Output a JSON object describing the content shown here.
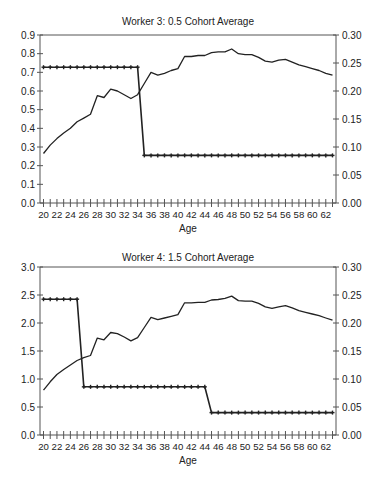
{
  "chart_data": [
    {
      "type": "line",
      "title": "Worker 3: 0.5 Cohort Average",
      "xlabel": "Age",
      "ylabel": "",
      "ylim": [
        0,
        0.9
      ],
      "y2lim": [
        0,
        0.3
      ],
      "yticks": [
        "0.0",
        "0.1",
        "0.2",
        "0.3",
        "0.4",
        "0.5",
        "0.6",
        "0.7",
        "0.8",
        "0.9"
      ],
      "y2ticks": [
        "0.00",
        "0.05",
        "0.10",
        "0.15",
        "0.20",
        "0.25",
        "0.30"
      ],
      "xticks": [
        "20",
        "22",
        "24",
        "26",
        "28",
        "30",
        "32",
        "34",
        "36",
        "38",
        "40",
        "42",
        "44",
        "46",
        "48",
        "50",
        "52",
        "54",
        "56",
        "58",
        "60",
        "62"
      ],
      "x": [
        20,
        21,
        22,
        23,
        24,
        25,
        26,
        27,
        28,
        29,
        30,
        31,
        32,
        33,
        34,
        35,
        36,
        37,
        38,
        39,
        40,
        41,
        42,
        43,
        44,
        45,
        46,
        47,
        48,
        49,
        50,
        51,
        52,
        53,
        54,
        55,
        56,
        57,
        58,
        59,
        60,
        61,
        62,
        63
      ],
      "series": [
        {
          "name": "line (left axis)",
          "axis": "left",
          "marker": "none",
          "values": [
            0.265,
            0.31,
            0.345,
            0.375,
            0.4,
            0.435,
            0.455,
            0.475,
            0.575,
            0.565,
            0.61,
            0.6,
            0.58,
            0.56,
            0.58,
            0.64,
            0.7,
            0.685,
            0.695,
            0.71,
            0.72,
            0.785,
            0.785,
            0.79,
            0.79,
            0.805,
            0.81,
            0.81,
            0.825,
            0.8,
            0.795,
            0.795,
            0.78,
            0.76,
            0.755,
            0.765,
            0.77,
            0.755,
            0.74,
            0.73,
            0.72,
            0.71,
            0.695,
            0.685
          ]
        },
        {
          "name": "marked line (right axis)",
          "axis": "right",
          "marker": "cross",
          "values": [
            0.2425,
            0.2425,
            0.2425,
            0.2425,
            0.2425,
            0.2425,
            0.2425,
            0.2425,
            0.2425,
            0.2425,
            0.2425,
            0.2425,
            0.2425,
            0.2425,
            0.2425,
            0.085,
            0.085,
            0.085,
            0.085,
            0.085,
            0.085,
            0.085,
            0.085,
            0.085,
            0.085,
            0.085,
            0.085,
            0.085,
            0.085,
            0.085,
            0.085,
            0.085,
            0.085,
            0.085,
            0.085,
            0.085,
            0.085,
            0.085,
            0.085,
            0.085,
            0.085,
            0.085,
            0.085,
            0.085
          ]
        }
      ],
      "grid": false,
      "legend": "none"
    },
    {
      "type": "line",
      "title": "Worker 4: 1.5 Cohort Average",
      "xlabel": "Age",
      "ylabel": "",
      "ylim": [
        0,
        3.0
      ],
      "y2lim": [
        0,
        0.3
      ],
      "yticks": [
        "0.0",
        "0.5",
        "1.0",
        "1.5",
        "2.0",
        "2.5",
        "3.0"
      ],
      "y2ticks": [
        "0.00",
        "0.05",
        "0.10",
        "0.15",
        "0.20",
        "0.25",
        "0.30"
      ],
      "xticks": [
        "20",
        "22",
        "24",
        "26",
        "28",
        "30",
        "32",
        "34",
        "36",
        "38",
        "40",
        "42",
        "44",
        "46",
        "48",
        "50",
        "52",
        "54",
        "56",
        "58",
        "60",
        "62"
      ],
      "x": [
        20,
        21,
        22,
        23,
        24,
        25,
        26,
        27,
        28,
        29,
        30,
        31,
        32,
        33,
        34,
        35,
        36,
        37,
        38,
        39,
        40,
        41,
        42,
        43,
        44,
        45,
        46,
        47,
        48,
        49,
        50,
        51,
        52,
        53,
        54,
        55,
        56,
        57,
        58,
        59,
        60,
        61,
        62,
        63
      ],
      "series": [
        {
          "name": "line (left axis)",
          "axis": "left",
          "marker": "none",
          "values": [
            0.8,
            0.95,
            1.08,
            1.17,
            1.25,
            1.33,
            1.38,
            1.42,
            1.73,
            1.7,
            1.83,
            1.81,
            1.75,
            1.68,
            1.74,
            1.92,
            2.1,
            2.06,
            2.09,
            2.12,
            2.15,
            2.36,
            2.36,
            2.37,
            2.37,
            2.41,
            2.42,
            2.44,
            2.48,
            2.4,
            2.39,
            2.39,
            2.35,
            2.29,
            2.26,
            2.29,
            2.31,
            2.27,
            2.22,
            2.19,
            2.16,
            2.13,
            2.09,
            2.05
          ]
        },
        {
          "name": "marked line (right axis)",
          "axis": "right",
          "marker": "cross",
          "values": [
            0.2425,
            0.2425,
            0.2425,
            0.2425,
            0.2425,
            0.2425,
            0.086,
            0.086,
            0.086,
            0.086,
            0.086,
            0.086,
            0.086,
            0.086,
            0.086,
            0.086,
            0.086,
            0.086,
            0.086,
            0.086,
            0.086,
            0.086,
            0.086,
            0.086,
            0.086,
            0.04,
            0.04,
            0.04,
            0.04,
            0.04,
            0.04,
            0.04,
            0.04,
            0.04,
            0.04,
            0.04,
            0.04,
            0.04,
            0.04,
            0.04,
            0.04,
            0.04,
            0.04,
            0.04
          ]
        }
      ],
      "grid": false,
      "legend": "none"
    }
  ],
  "colors": {
    "line": "#222222",
    "axis": "#555555",
    "background": "#ffffff"
  }
}
